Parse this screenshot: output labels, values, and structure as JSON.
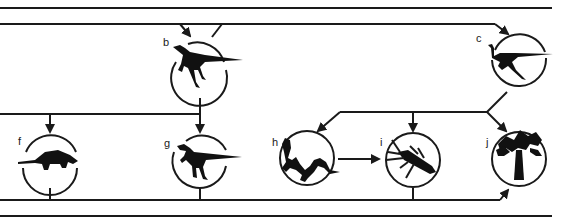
{
  "diagram": {
    "type": "food-web",
    "colors": {
      "line": "#1a1a1a",
      "silhouette": "#111111",
      "background": "#ffffff"
    },
    "nodes": [
      {
        "id": "b",
        "label": "b",
        "depicts": "small-bipedal-dinosaur"
      },
      {
        "id": "c",
        "label": "c",
        "depicts": "ostrich-like-dinosaur"
      },
      {
        "id": "f",
        "label": "f",
        "depicts": "armored-ankylosaur"
      },
      {
        "id": "g",
        "label": "g",
        "depicts": "theropod-dinosaur"
      },
      {
        "id": "h",
        "label": "h",
        "depicts": "lizard"
      },
      {
        "id": "i",
        "label": "i",
        "depicts": "beetle-insect"
      },
      {
        "id": "j",
        "label": "j",
        "depicts": "cycad-palm-plant"
      }
    ],
    "edges": [
      {
        "from": "top-band",
        "to": "b"
      },
      {
        "from": "top-band",
        "to": "c"
      },
      {
        "from": "b",
        "to": "f"
      },
      {
        "from": "b",
        "to": "g"
      },
      {
        "from": "c",
        "to": "h"
      },
      {
        "from": "c",
        "to": "i"
      },
      {
        "from": "c",
        "to": "j"
      },
      {
        "from": "h",
        "to": "i"
      },
      {
        "from": "bottom-band",
        "to": "j"
      }
    ]
  }
}
